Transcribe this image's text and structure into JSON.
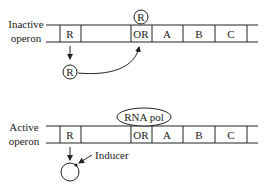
{
  "inactive": {
    "label_line1": "Inactive",
    "label_line2": "operon",
    "segments": [
      "R",
      "OR",
      "A",
      "B",
      "C"
    ],
    "bound_repressor": "R",
    "free_repressor": "R"
  },
  "active": {
    "label_line1": "Active",
    "label_line2": "operon",
    "segments": [
      "R",
      "OR",
      "A",
      "B",
      "C"
    ],
    "polymerase": "RNA pol",
    "inducer_label": "Inducer"
  },
  "colors": {
    "stroke": "#222222",
    "background": "#ffffff"
  }
}
